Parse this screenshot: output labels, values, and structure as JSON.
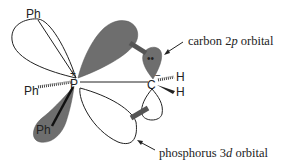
{
  "diagram": {
    "atoms": {
      "phosphorus": "P",
      "carbon": "C",
      "phenyl_top": "Ph",
      "phenyl_left": "Ph",
      "phenyl_bottom": "Ph",
      "hydrogen_top": "H",
      "hydrogen_bottom": "H"
    },
    "charges": {
      "phosphorus": "+",
      "carbon": "−"
    },
    "lone_pair": "••",
    "labels": {
      "carbon_orbital_prefix": "carbon 2",
      "carbon_orbital_italic": "p",
      "carbon_orbital_suffix": " orbital",
      "phosphorus_orbital_prefix": "phosphorus 3",
      "phosphorus_orbital_italic": "d",
      "phosphorus_orbital_suffix": " orbital"
    },
    "colors": {
      "filled_lobe": "#6e6e6e",
      "outline": "#222222",
      "overlap_hatch": "#555555"
    }
  }
}
